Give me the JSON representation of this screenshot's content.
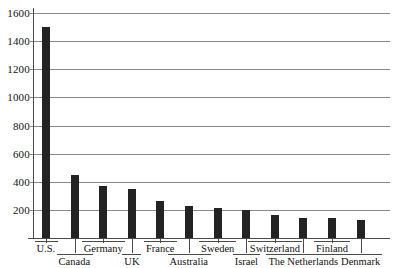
{
  "chart_data": {
    "type": "bar",
    "title": "",
    "subtitle": "",
    "xlabel": "",
    "ylabel": "",
    "ylim": [
      0,
      1600
    ],
    "ytick_values": [
      200,
      400,
      600,
      800,
      1000,
      1200,
      1400,
      1600
    ],
    "ytick_labels": [
      "200",
      "400",
      "600",
      "800",
      "1000",
      "1200",
      "1400",
      "1600"
    ],
    "grid": true,
    "legend": null,
    "legend_position": "none",
    "bar_color": "#232323",
    "axis_color": "#4a4a4a",
    "grid_color": "#8b8b8b",
    "categories": [
      "U.S.",
      "Canada",
      "Germany",
      "UK",
      "France",
      "Australia",
      "Sweden",
      "Israel",
      "Switzerland",
      "The Netherlands",
      "Finland",
      "Denmark"
    ],
    "values": [
      1500,
      450,
      370,
      350,
      265,
      230,
      215,
      200,
      165,
      145,
      140,
      130
    ],
    "label_rows": [
      1,
      2,
      1,
      2,
      1,
      2,
      1,
      2,
      1,
      2,
      1,
      2
    ]
  }
}
